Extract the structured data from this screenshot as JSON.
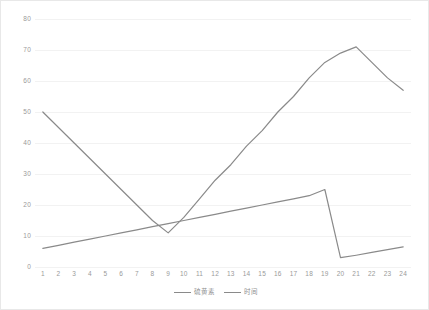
{
  "chart_data": {
    "type": "line",
    "title": "",
    "subtitle": "",
    "xlabel": "",
    "ylabel": "",
    "x": [
      1,
      2,
      3,
      4,
      5,
      6,
      7,
      8,
      9,
      10,
      11,
      12,
      13,
      14,
      15,
      16,
      17,
      18,
      19,
      20,
      21,
      22,
      23,
      24
    ],
    "categories": [
      "1",
      "2",
      "3",
      "4",
      "5",
      "6",
      "7",
      "8",
      "9",
      "10",
      "11",
      "12",
      "13",
      "14",
      "15",
      "16",
      "17",
      "18",
      "19",
      "20",
      "21",
      "22",
      "23",
      "24"
    ],
    "series": [
      {
        "name": "硫黄素",
        "color": "#8a8a8a",
        "values": [
          50,
          45,
          40,
          35,
          30,
          25,
          20,
          15,
          11,
          16,
          22,
          28,
          33,
          39,
          44,
          50,
          55,
          61,
          66,
          69,
          71,
          66,
          61,
          57
        ]
      },
      {
        "name": "时间",
        "color": "#8a8a8a",
        "values": [
          6,
          7,
          8,
          9,
          10,
          11,
          12,
          13,
          14,
          15,
          16,
          17,
          18,
          19,
          20,
          21,
          22,
          23,
          25,
          3,
          3.8,
          4.7,
          5.6,
          6.5
        ]
      }
    ],
    "ylim": [
      0,
      80
    ],
    "yticks": [
      0,
      10,
      20,
      30,
      40,
      50,
      60,
      70,
      80
    ],
    "ytick_labels": [
      "0",
      "10",
      "20",
      "30",
      "40",
      "50",
      "60",
      "70",
      "80"
    ],
    "grid": true,
    "grid_axis": "y",
    "grid_color": "#f2f2f2",
    "legend_position": "bottom-center"
  },
  "figure": {
    "background_color": "#ffffff",
    "border_color": "#e8e8e8",
    "tick_label_color": "#9a9a9a"
  }
}
